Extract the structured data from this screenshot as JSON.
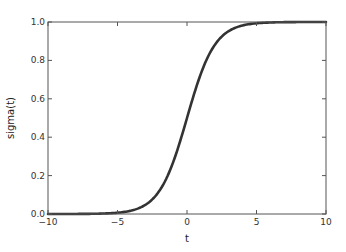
{
  "chart_data": {
    "type": "line",
    "title": "",
    "xlabel": "t",
    "ylabel": "sigma(t)",
    "xlim": [
      -10,
      10
    ],
    "ylim": [
      0.0,
      1.0
    ],
    "grid": false,
    "legend": null,
    "x_ticks": [
      -10,
      -5,
      0,
      5,
      10
    ],
    "x_tick_labels": [
      "−10",
      "−5",
      "0",
      "5",
      "10"
    ],
    "y_ticks": [
      0.0,
      0.2,
      0.4,
      0.6,
      0.8,
      1.0
    ],
    "y_tick_labels": [
      "0.0",
      "0.2",
      "0.4",
      "0.6",
      "0.8",
      "1.0"
    ],
    "series": [
      {
        "name": "sigma(t) = 1/(1+e^-t)",
        "color": "#333333",
        "x": [
          -10,
          -8,
          -6,
          -5,
          -4,
          -3,
          -2,
          -1,
          0,
          1,
          2,
          3,
          4,
          5,
          6,
          8,
          10
        ],
        "y": [
          0.0,
          0.0003,
          0.0025,
          0.0067,
          0.018,
          0.047,
          0.119,
          0.269,
          0.5,
          0.731,
          0.881,
          0.953,
          0.982,
          0.9933,
          0.9975,
          0.9997,
          1.0
        ]
      }
    ]
  }
}
